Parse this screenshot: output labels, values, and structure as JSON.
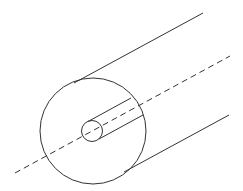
{
  "diagram": {
    "type": "coaxial-cylinder",
    "stroke_color": "#333333",
    "background": "#ffffff",
    "outer_circle": {
      "cx": 93,
      "cy": 131,
      "r": 53
    },
    "inner_circle": {
      "cx": 92,
      "cy": 131,
      "r": 10.5
    },
    "outer_top_line": {
      "x1": 74,
      "y1": 83,
      "x2": 203,
      "y2": 13
    },
    "outer_bottom_line": {
      "x1": 124,
      "y1": 172,
      "x2": 229,
      "y2": 115
    },
    "inner_top_line": {
      "x1": 88,
      "y1": 121.5,
      "x2": 131,
      "y2": 98
    },
    "inner_bottom_line": {
      "x1": 99,
      "y1": 139,
      "x2": 143,
      "y2": 115
    },
    "axis_line": {
      "x1": 15,
      "y1": 173,
      "x2": 230,
      "y2": 56,
      "dash": "6 4"
    }
  }
}
